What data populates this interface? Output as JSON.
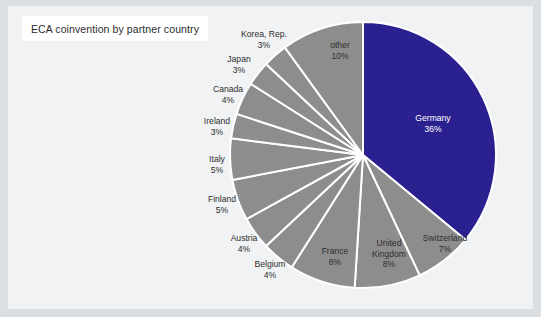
{
  "window": {
    "background_color": "#dcdfe1",
    "panel_color": "#f1f2f3"
  },
  "title": {
    "text": "ECA coinvention by partner country",
    "box_background": "#ffffff",
    "text_color": "#2a2a2a"
  },
  "chart_data": {
    "type": "pie",
    "title": "ECA coinvention by partner country",
    "xlabel": "",
    "ylabel": "",
    "legend_position": "none",
    "grid": false,
    "value_unit": "%",
    "start_angle_deg": 0,
    "direction": "clockwise",
    "categories": [
      "Germany",
      "Switzerland",
      "United Kingdom",
      "France",
      "Belgium",
      "Austria",
      "Finland",
      "Italy",
      "Ireland",
      "Canada",
      "Japan",
      "Korea, Rep.",
      "other"
    ],
    "values": [
      36,
      7,
      8,
      8,
      4,
      4,
      5,
      5,
      3,
      4,
      3,
      3,
      10
    ],
    "colors": [
      "#2a2090",
      "#8d8d8d",
      "#8d8d8d",
      "#8d8d8d",
      "#8d8d8d",
      "#8d8d8d",
      "#8d8d8d",
      "#8d8d8d",
      "#8d8d8d",
      "#8d8d8d",
      "#8d8d8d",
      "#8d8d8d",
      "#8d8d8d"
    ],
    "slices": [
      {
        "label": "Germany",
        "value": 36,
        "value_label": "36%",
        "color": "#2a2090",
        "label_placement": "inside",
        "label_color": "#ffffff"
      },
      {
        "label": "Switzerland",
        "value": 7,
        "value_label": "7%",
        "color": "#8d8d8d",
        "label_placement": "inside",
        "label_color": "#2e2e2e"
      },
      {
        "label": "United Kingdom",
        "value": 8,
        "value_label": "8%",
        "color": "#8d8d8d",
        "label_placement": "inside",
        "label_color": "#2e2e2e"
      },
      {
        "label": "France",
        "value": 8,
        "value_label": "8%",
        "color": "#8d8d8d",
        "label_placement": "inside",
        "label_color": "#2e2e2e"
      },
      {
        "label": "Belgium",
        "value": 4,
        "value_label": "4%",
        "color": "#8d8d8d",
        "label_placement": "outside",
        "label_color": "#2e2e2e"
      },
      {
        "label": "Austria",
        "value": 4,
        "value_label": "4%",
        "color": "#8d8d8d",
        "label_placement": "outside",
        "label_color": "#2e2e2e"
      },
      {
        "label": "Finland",
        "value": 5,
        "value_label": "5%",
        "color": "#8d8d8d",
        "label_placement": "outside",
        "label_color": "#2e2e2e"
      },
      {
        "label": "Italy",
        "value": 5,
        "value_label": "5%",
        "color": "#8d8d8d",
        "label_placement": "outside",
        "label_color": "#2e2e2e"
      },
      {
        "label": "Ireland",
        "value": 3,
        "value_label": "3%",
        "color": "#8d8d8d",
        "label_placement": "outside",
        "label_color": "#2e2e2e"
      },
      {
        "label": "Canada",
        "value": 4,
        "value_label": "4%",
        "color": "#8d8d8d",
        "label_placement": "outside",
        "label_color": "#2e2e2e"
      },
      {
        "label": "Japan",
        "value": 3,
        "value_label": "3%",
        "color": "#8d8d8d",
        "label_placement": "outside",
        "label_color": "#2e2e2e"
      },
      {
        "label": "Korea, Rep.",
        "value": 3,
        "value_label": "3%",
        "color": "#8d8d8d",
        "label_placement": "outside",
        "label_color": "#2e2e2e"
      },
      {
        "label": "other",
        "value": 10,
        "value_label": "10%",
        "color": "#8d8d8d",
        "label_placement": "inside",
        "label_color": "#2e2e2e"
      }
    ],
    "geometry": {
      "center_x": 355,
      "center_y": 149,
      "radius": 133,
      "separator_color": "#ffffff",
      "separator_width": 2
    }
  }
}
